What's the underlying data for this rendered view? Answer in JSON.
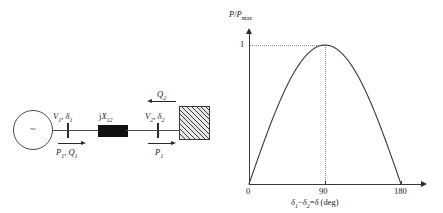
{
  "figure": {
    "kind": "two-bus-power-transfer-figure",
    "background_color": "#ffffff",
    "ink_color": "#1a1a1a"
  },
  "circuit": {
    "title": "Two-bus system with series reactance",
    "source": {
      "name": "ac-voltage-source",
      "symbol": "~"
    },
    "sending_bus": {
      "voltage_angle_label": "V1, δ1",
      "voltage_symbol": "V",
      "voltage_subscript": "1",
      "angle_symbol": "δ",
      "angle_subscript": "1",
      "power_label": "P1, Q1",
      "power_symbol": "P",
      "power_subscript": "1",
      "reactive_symbol": "Q",
      "reactive_subscript": "1",
      "power_arrow_direction": "right"
    },
    "series_element": {
      "label": "jX12",
      "prefix": "j",
      "symbol": "X",
      "subscript": "12",
      "style": "filled-black-rectangle"
    },
    "receiving_bus": {
      "voltage_angle_label": "V2, δ2",
      "voltage_symbol": "V",
      "voltage_subscript": "2",
      "angle_symbol": "δ",
      "angle_subscript": "2",
      "real_power_label": "P1",
      "real_power_symbol": "P",
      "real_power_subscript": "1",
      "real_power_arrow_direction": "right",
      "reactive_power_label": "Q2",
      "reactive_power_symbol": "Q",
      "reactive_power_subscript": "2",
      "reactive_power_arrow_direction": "left"
    },
    "load": {
      "name": "load-block",
      "style": "hatched-rectangle"
    }
  },
  "chart_data": {
    "type": "line",
    "title": "",
    "ylabel": "P/Pmax",
    "ylabel_numerator": "P",
    "ylabel_denominator_symbol": "P",
    "ylabel_denominator_subscript": "max",
    "xlabel": "δ1 − δ2 = δ (deg)",
    "xlabel_parts": {
      "d1_symbol": "δ",
      "d1_subscript": "1",
      "minus": "−",
      "d2_symbol": "δ",
      "d2_subscript": "2",
      "equals": "=",
      "d_symbol": "δ",
      "units": "(deg)"
    },
    "x": [
      0,
      10,
      20,
      30,
      40,
      50,
      60,
      70,
      80,
      90,
      100,
      110,
      120,
      130,
      140,
      150,
      160,
      170,
      180
    ],
    "values": [
      0,
      0.174,
      0.342,
      0.5,
      0.643,
      0.766,
      0.866,
      0.94,
      0.985,
      1.0,
      0.985,
      0.94,
      0.866,
      0.766,
      0.643,
      0.5,
      0.342,
      0.174,
      0
    ],
    "formula": "P/Pmax = sin(delta)",
    "xlim": [
      0,
      180
    ],
    "ylim": [
      0,
      1.12
    ],
    "xticks": [
      0,
      90,
      180
    ],
    "xtick_labels": [
      "0",
      "90",
      "180"
    ],
    "yticks": [
      1
    ],
    "ytick_labels": [
      "1"
    ],
    "grid": false,
    "legend": null,
    "annotations": [
      {
        "name": "peak-guide-horizontal",
        "type": "dotted-line",
        "from": [
          0,
          1
        ],
        "to": [
          90,
          1
        ]
      },
      {
        "name": "peak-guide-vertical",
        "type": "dotted-line",
        "from": [
          90,
          0
        ],
        "to": [
          90,
          1
        ]
      }
    ],
    "curve_color": "#3a3a3a",
    "guide_color": "#8a8a8a"
  }
}
